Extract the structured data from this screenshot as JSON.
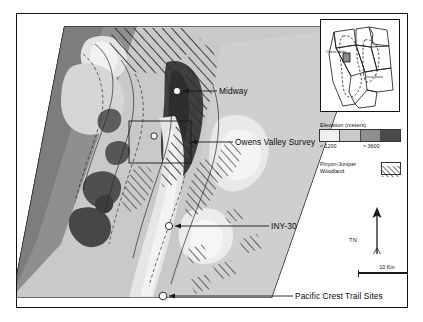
{
  "figure": {
    "type": "map",
    "region": "Owens Valley, eastern California"
  },
  "callouts": [
    {
      "id": "midway",
      "label": "Midway"
    },
    {
      "id": "ovs",
      "label": "Owens Valley Survey"
    },
    {
      "id": "iny30",
      "label": "INY-30"
    },
    {
      "id": "pcts",
      "label": "Pacific Crest Trail Sites"
    }
  ],
  "legend": {
    "elevation": {
      "title": "Elevation (meters)",
      "low_label": "< 1200",
      "high_label": "> 3600",
      "swatches": [
        "#efefef",
        "#c9c9c9",
        "#8f8f8f",
        "#4a4a4a"
      ],
      "breaks": [
        1200,
        2000,
        2800,
        3600
      ]
    },
    "vegetation": {
      "label_line1": "Pinyon-Juniper",
      "label_line2": "Woodland",
      "pattern": "diagonal-hatch"
    }
  },
  "north_arrow": {
    "label": "TN"
  },
  "scale_bar": {
    "label": "10 Km",
    "length_km": 10
  },
  "inset": {
    "states": [
      "California",
      "Oregon",
      "Nevada",
      "Idaho",
      "Utah",
      "Arizona"
    ],
    "labels": [
      {
        "text": "Great Basin"
      },
      {
        "text": "Owens Valley"
      }
    ]
  },
  "site_markers": [
    {
      "name": "Midway"
    },
    {
      "name": "Owens Valley Survey"
    },
    {
      "name": "INY-30"
    },
    {
      "name": "Pacific Crest Trail Sites"
    }
  ],
  "colors": {
    "frame": "#111111",
    "background": "#ffffff",
    "elev1": "#efefef",
    "elev2": "#c9c9c9",
    "elev3": "#8f8f8f",
    "elev4": "#4a4a4a",
    "leader_line": "#1a1a1a",
    "marker_fill": "#ffffff"
  }
}
